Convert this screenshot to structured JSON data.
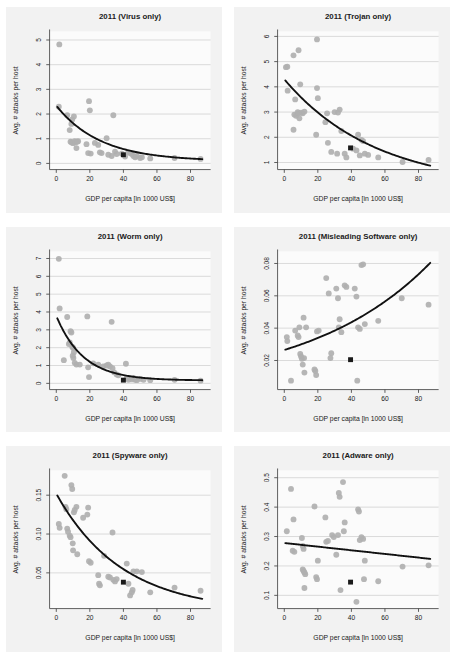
{
  "figure": {
    "name": "malware-attacks-vs-gdp-panels",
    "panel_count": 6,
    "colors": {
      "panel_background": "#f2f2f2",
      "plot_background": "#fbfbfb",
      "point": "#b0b0b0",
      "fit_line": "#111111",
      "highlight_marker": "#1a1a1a",
      "gridline": "#c9c9c9",
      "axis": "#444444",
      "text": "#1a1a1a"
    }
  },
  "common": {
    "xlabel": "GDP per capita [in 1000 US$]",
    "ylabel": "Avg. # attacks per host",
    "xticks": [
      0,
      20,
      40,
      60,
      80
    ],
    "xlim": [
      -4,
      92
    ]
  },
  "chart_data": [
    {
      "type": "scatter",
      "id": "virus",
      "title": "2011 (Virus only)",
      "xlabel": "GDP per capita [in 1000 US$]",
      "ylabel": "Avg. # attacks per host",
      "xlim": [
        -4,
        92
      ],
      "ylim": [
        -0.25,
        5.35
      ],
      "xticks": [
        0,
        20,
        40,
        60,
        80
      ],
      "yticks": [
        0,
        1,
        2,
        3,
        4,
        5
      ],
      "ytick_labels": [
        "0",
        "1",
        "2",
        "3",
        "4",
        "5"
      ],
      "grid": true,
      "legend": "none",
      "points": [
        [
          1.8,
          4.82
        ],
        [
          1.5,
          2.3
        ],
        [
          6.5,
          1.95
        ],
        [
          8.0,
          1.35
        ],
        [
          9.0,
          1.6
        ],
        [
          9.5,
          1.78
        ],
        [
          10.5,
          1.9
        ],
        [
          8.5,
          0.88
        ],
        [
          9.2,
          0.85
        ],
        [
          10.0,
          0.82
        ],
        [
          11.0,
          0.9
        ],
        [
          11.5,
          0.85
        ],
        [
          12.0,
          0.62
        ],
        [
          12.5,
          0.88
        ],
        [
          13.0,
          0.9
        ],
        [
          19.5,
          2.52
        ],
        [
          20.0,
          2.15
        ],
        [
          18.0,
          0.78
        ],
        [
          19.0,
          0.42
        ],
        [
          20.5,
          0.4
        ],
        [
          23.0,
          0.83
        ],
        [
          25.0,
          0.75
        ],
        [
          26.0,
          0.45
        ],
        [
          27.0,
          0.42
        ],
        [
          30.0,
          1.02
        ],
        [
          31.0,
          0.35
        ],
        [
          33.0,
          0.3
        ],
        [
          34.0,
          1.95
        ],
        [
          35.0,
          0.48
        ],
        [
          36.0,
          0.38
        ],
        [
          39.0,
          0.4
        ],
        [
          41.0,
          0.28
        ],
        [
          43.0,
          0.45
        ],
        [
          44.0,
          0.42
        ],
        [
          45.0,
          0.38
        ],
        [
          46.0,
          0.3
        ],
        [
          47.0,
          0.25
        ],
        [
          48.0,
          0.3
        ],
        [
          50.0,
          0.22
        ],
        [
          51.0,
          0.25
        ],
        [
          56.0,
          0.2
        ],
        [
          70.5,
          0.22
        ],
        [
          86.0,
          0.18
        ]
      ],
      "highlight": [
        40.0,
        0.35
      ],
      "fit": {
        "form": "exponential",
        "a": 2.25,
        "b": -0.038,
        "c": 0.09
      }
    },
    {
      "type": "scatter",
      "id": "trojan",
      "title": "2011 (Trojan only)",
      "xlabel": "GDP per capita [in 1000 US$]",
      "ylabel": "Avg. # attacks per host",
      "xlim": [
        -4,
        92
      ],
      "ylim": [
        0.72,
        6.2
      ],
      "xticks": [
        0,
        20,
        40,
        60,
        80
      ],
      "yticks": [
        1,
        2,
        3,
        4,
        5,
        6
      ],
      "ytick_labels": [
        "1",
        "2",
        "3",
        "4",
        "5",
        "6"
      ],
      "grid": true,
      "legend": "none",
      "points": [
        [
          1.0,
          4.78
        ],
        [
          1.8,
          4.8
        ],
        [
          2.0,
          3.85
        ],
        [
          5.5,
          5.25
        ],
        [
          8.5,
          5.45
        ],
        [
          19.5,
          5.88
        ],
        [
          9.5,
          4.1
        ],
        [
          6.5,
          3.5
        ],
        [
          6.0,
          2.9
        ],
        [
          7.0,
          2.85
        ],
        [
          8.0,
          3.0
        ],
        [
          8.5,
          2.95
        ],
        [
          9.0,
          2.75
        ],
        [
          10.0,
          2.98
        ],
        [
          11.0,
          2.95
        ],
        [
          12.0,
          3.02
        ],
        [
          5.5,
          2.3
        ],
        [
          19.5,
          3.95
        ],
        [
          19.0,
          2.1
        ],
        [
          20.0,
          3.55
        ],
        [
          24.5,
          2.6
        ],
        [
          25.5,
          2.95
        ],
        [
          26.0,
          1.78
        ],
        [
          28.0,
          1.42
        ],
        [
          30.0,
          3.0
        ],
        [
          32.0,
          2.98
        ],
        [
          33.0,
          3.1
        ],
        [
          31.5,
          1.35
        ],
        [
          34.0,
          2.25
        ],
        [
          36.0,
          1.35
        ],
        [
          37.0,
          1.2
        ],
        [
          41.0,
          1.55
        ],
        [
          43.0,
          1.48
        ],
        [
          44.0,
          2.1
        ],
        [
          45.0,
          1.28
        ],
        [
          46.0,
          1.9
        ],
        [
          47.0,
          1.85
        ],
        [
          48.0,
          1.35
        ],
        [
          50.0,
          1.3
        ],
        [
          56.0,
          1.2
        ],
        [
          70.5,
          1.02
        ],
        [
          86.0,
          1.1
        ]
      ],
      "highlight": [
        39.5,
        1.58
      ],
      "fit": {
        "form": "exponential",
        "a": 4.3,
        "b": -0.0183,
        "c": 0.0
      }
    },
    {
      "type": "scatter",
      "id": "worm",
      "title": "2011 (Worm only)",
      "xlabel": "GDP per capita [in 1000 US$]",
      "ylabel": "Avg. # attacks per host",
      "xlim": [
        -4,
        92
      ],
      "ylim": [
        -0.35,
        7.4
      ],
      "xticks": [
        0,
        20,
        40,
        60,
        80
      ],
      "yticks": [
        0,
        1,
        2,
        3,
        4,
        5,
        6,
        7
      ],
      "ytick_labels": [
        "0",
        "1",
        "2",
        "3",
        "4",
        "5",
        "6",
        "7"
      ],
      "grid": true,
      "legend": "none",
      "points": [
        [
          1.5,
          6.98
        ],
        [
          2.0,
          4.2
        ],
        [
          6.5,
          3.72
        ],
        [
          18.5,
          3.75
        ],
        [
          33.0,
          3.45
        ],
        [
          8.5,
          2.92
        ],
        [
          9.0,
          2.85
        ],
        [
          8.0,
          2.3
        ],
        [
          7.5,
          2.2
        ],
        [
          9.5,
          2.05
        ],
        [
          10.0,
          2.0
        ],
        [
          10.5,
          1.75
        ],
        [
          9.8,
          1.55
        ],
        [
          10.2,
          1.42
        ],
        [
          4.5,
          1.3
        ],
        [
          11.0,
          1.15
        ],
        [
          12.0,
          1.05
        ],
        [
          14.0,
          1.05
        ],
        [
          19.0,
          0.9
        ],
        [
          19.5,
          0.35
        ],
        [
          22.0,
          1.12
        ],
        [
          25.0,
          1.05
        ],
        [
          28.0,
          0.95
        ],
        [
          30.0,
          1.0
        ],
        [
          31.0,
          1.05
        ],
        [
          32.0,
          0.95
        ],
        [
          33.5,
          0.85
        ],
        [
          34.5,
          0.62
        ],
        [
          36.0,
          0.5
        ],
        [
          37.0,
          0.45
        ],
        [
          41.5,
          1.1
        ],
        [
          42.0,
          0.3
        ],
        [
          43.0,
          0.2
        ],
        [
          44.0,
          0.28
        ],
        [
          45.0,
          0.22
        ],
        [
          46.0,
          0.3
        ],
        [
          47.0,
          0.2
        ],
        [
          48.0,
          0.18
        ],
        [
          50.0,
          0.25
        ],
        [
          52.0,
          0.2
        ],
        [
          56.0,
          0.18
        ],
        [
          70.5,
          0.2
        ],
        [
          86.0,
          0.15
        ]
      ],
      "highlight": [
        40.0,
        0.18
      ],
      "fit": {
        "form": "exponential",
        "a": 3.62,
        "b": -0.062,
        "c": 0.16
      }
    },
    {
      "type": "scatter",
      "id": "misleading-software",
      "title": "2011 (Misleading Software only)",
      "xlabel": "GDP per capita [in 1000 US$]",
      "ylabel": "Avg. # attacks per host",
      "xlim": [
        -4,
        92
      ],
      "ylim": [
        0.002,
        0.0875
      ],
      "xticks": [
        0,
        20,
        40,
        60,
        80
      ],
      "yticks": [
        0.02,
        0.04,
        0.06,
        0.08
      ],
      "ytick_labels": [
        "0.02",
        "0.04",
        "0.06",
        "0.08"
      ],
      "grid": true,
      "legend": "none",
      "points": [
        [
          1.5,
          0.0345
        ],
        [
          1.8,
          0.032
        ],
        [
          4.0,
          0.0075
        ],
        [
          6.5,
          0.0385
        ],
        [
          8.0,
          0.0355
        ],
        [
          8.5,
          0.0345
        ],
        [
          9.0,
          0.0405
        ],
        [
          9.5,
          0.024
        ],
        [
          10.0,
          0.0225
        ],
        [
          10.5,
          0.021
        ],
        [
          11.0,
          0.0175
        ],
        [
          11.5,
          0.0465
        ],
        [
          11.8,
          0.0215
        ],
        [
          12.0,
          0.0125
        ],
        [
          13.0,
          0.0405
        ],
        [
          18.0,
          0.0145
        ],
        [
          18.5,
          0.0135
        ],
        [
          19.0,
          0.011
        ],
        [
          19.5,
          0.038
        ],
        [
          20.5,
          0.0385
        ],
        [
          25.0,
          0.071
        ],
        [
          26.5,
          0.0615
        ],
        [
          27.5,
          0.0215
        ],
        [
          28.0,
          0.0245
        ],
        [
          31.0,
          0.0645
        ],
        [
          32.0,
          0.0585
        ],
        [
          32.5,
          0.0405
        ],
        [
          33.0,
          0.0455
        ],
        [
          34.0,
          0.0375
        ],
        [
          36.0,
          0.0665
        ],
        [
          37.0,
          0.0655
        ],
        [
          42.0,
          0.0645
        ],
        [
          43.0,
          0.0595
        ],
        [
          43.5,
          0.0075
        ],
        [
          44.0,
          0.0405
        ],
        [
          45.0,
          0.0395
        ],
        [
          46.0,
          0.079
        ],
        [
          47.0,
          0.0795
        ],
        [
          48.0,
          0.0425
        ],
        [
          56.0,
          0.0445
        ],
        [
          70.0,
          0.0585
        ],
        [
          86.0,
          0.0545
        ]
      ],
      "highlight": [
        39.5,
        0.0205
      ],
      "fit": {
        "form": "exponential_growth",
        "a": 0.0235,
        "b": 0.0137,
        "c": 0.003
      }
    },
    {
      "type": "scatter",
      "id": "spyware",
      "title": "2011 (Spyware only)",
      "xlabel": "GDP per capita [in 1000 US$]",
      "ylabel": "Avg. # attacks per host",
      "xlim": [
        -4,
        92
      ],
      "ylim": [
        0.004,
        0.182
      ],
      "xticks": [
        0,
        20,
        40,
        60,
        80
      ],
      "yticks": [
        0.05,
        0.1,
        0.15
      ],
      "ytick_labels": [
        "0.05",
        "0.10",
        "0.15"
      ],
      "grid": true,
      "legend": "none",
      "points": [
        [
          5.0,
          0.175
        ],
        [
          9.0,
          0.163
        ],
        [
          9.5,
          0.158
        ],
        [
          1.5,
          0.113
        ],
        [
          2.0,
          0.108
        ],
        [
          5.5,
          0.135
        ],
        [
          6.0,
          0.132
        ],
        [
          6.5,
          0.107
        ],
        [
          7.0,
          0.103
        ],
        [
          8.0,
          0.098
        ],
        [
          8.5,
          0.096
        ],
        [
          9.8,
          0.088
        ],
        [
          10.5,
          0.128
        ],
        [
          11.0,
          0.131
        ],
        [
          12.0,
          0.135
        ],
        [
          10.0,
          0.079
        ],
        [
          12.5,
          0.074
        ],
        [
          16.0,
          0.121
        ],
        [
          18.5,
          0.125
        ],
        [
          19.0,
          0.134
        ],
        [
          19.5,
          0.065
        ],
        [
          20.5,
          0.063
        ],
        [
          25.0,
          0.047
        ],
        [
          25.5,
          0.036
        ],
        [
          26.0,
          0.034
        ],
        [
          28.5,
          0.072
        ],
        [
          31.0,
          0.045
        ],
        [
          32.0,
          0.044
        ],
        [
          33.5,
          0.102
        ],
        [
          34.0,
          0.041
        ],
        [
          35.0,
          0.039
        ],
        [
          36.0,
          0.042
        ],
        [
          42.0,
          0.062
        ],
        [
          43.0,
          0.036
        ],
        [
          44.0,
          0.021
        ],
        [
          45.0,
          0.025
        ],
        [
          45.5,
          0.028
        ],
        [
          46.0,
          0.052
        ],
        [
          48.0,
          0.052
        ],
        [
          51.0,
          0.051
        ],
        [
          56.0,
          0.025
        ],
        [
          70.5,
          0.031
        ],
        [
          86.0,
          0.027
        ]
      ],
      "highlight": [
        40.0,
        0.038
      ],
      "fit": {
        "form": "exponential",
        "a": 0.152,
        "b": -0.0255,
        "c": 0.0
      }
    },
    {
      "type": "scatter",
      "id": "adware",
      "title": "2011 (Adware only)",
      "xlabel": "GDP per capita [in 1000 US$]",
      "ylabel": "Avg. # attacks per host",
      "xlim": [
        -4,
        92
      ],
      "ylim": [
        0.055,
        0.525
      ],
      "xticks": [
        0,
        20,
        40,
        60,
        80
      ],
      "yticks": [
        0.1,
        0.2,
        0.3,
        0.4,
        0.5
      ],
      "ytick_labels": [
        "0.1",
        "0.2",
        "0.3",
        "0.4",
        "0.5"
      ],
      "grid": true,
      "legend": "none",
      "points": [
        [
          1.5,
          0.318
        ],
        [
          4.0,
          0.462
        ],
        [
          5.5,
          0.358
        ],
        [
          5.0,
          0.252
        ],
        [
          6.0,
          0.248
        ],
        [
          10.5,
          0.295
        ],
        [
          11.0,
          0.268
        ],
        [
          11.5,
          0.258
        ],
        [
          11.0,
          0.188
        ],
        [
          11.5,
          0.183
        ],
        [
          12.0,
          0.178
        ],
        [
          12.5,
          0.172
        ],
        [
          12.0,
          0.125
        ],
        [
          18.0,
          0.402
        ],
        [
          19.0,
          0.162
        ],
        [
          19.5,
          0.155
        ],
        [
          20.0,
          0.218
        ],
        [
          24.5,
          0.365
        ],
        [
          25.0,
          0.282
        ],
        [
          26.0,
          0.285
        ],
        [
          28.5,
          0.305
        ],
        [
          29.5,
          0.298
        ],
        [
          31.0,
          0.238
        ],
        [
          32.0,
          0.305
        ],
        [
          32.5,
          0.448
        ],
        [
          33.0,
          0.435
        ],
        [
          33.5,
          0.118
        ],
        [
          35.0,
          0.485
        ],
        [
          35.5,
          0.318
        ],
        [
          36.0,
          0.348
        ],
        [
          43.0,
          0.078
        ],
        [
          44.0,
          0.392
        ],
        [
          44.5,
          0.385
        ],
        [
          45.0,
          0.288
        ],
        [
          46.0,
          0.298
        ],
        [
          47.0,
          0.292
        ],
        [
          47.5,
          0.155
        ],
        [
          48.0,
          0.218
        ],
        [
          56.0,
          0.148
        ],
        [
          70.5,
          0.198
        ],
        [
          86.0,
          0.202
        ]
      ],
      "highlight": [
        39.5,
        0.145
      ],
      "fit": {
        "form": "linear",
        "a": 0.278,
        "b": -0.00062
      }
    }
  ]
}
